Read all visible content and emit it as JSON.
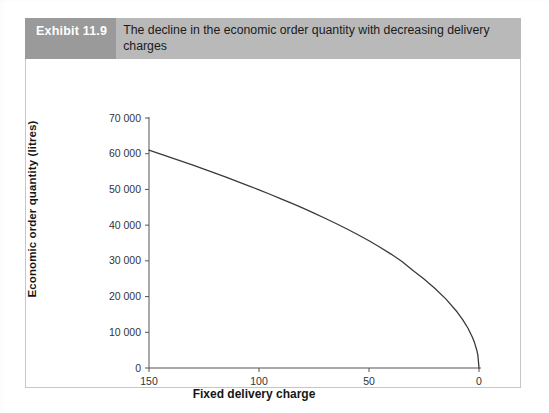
{
  "exhibit": {
    "badge": "Exhibit 11.9",
    "title": "The decline in the economic order quantity with decreasing delivery charges"
  },
  "chart_data": {
    "type": "line",
    "title": "The decline in the economic order quantity with decreasing delivery charges",
    "xlabel": "Fixed delivery charge",
    "ylabel": "Economic order quantity (litres)",
    "xlim": [
      150,
      0
    ],
    "ylim": [
      0,
      70000
    ],
    "x_reversed": true,
    "grid": false,
    "legend": null,
    "xticks": [
      150,
      100,
      50,
      0
    ],
    "xticklabels": [
      "150",
      "100",
      "50",
      "0"
    ],
    "yticks": [
      0,
      10000,
      20000,
      30000,
      40000,
      50000,
      60000,
      70000
    ],
    "yticklabels": [
      "0",
      "10 000",
      "20 000",
      "30 000",
      "40 000",
      "50 000",
      "60 000",
      "70 000"
    ],
    "series": [
      {
        "name": "Economic order quantity",
        "color": "#3a3a3a",
        "x": [
          150,
          145,
          140,
          135,
          130,
          125,
          120,
          115,
          110,
          105,
          100,
          95,
          90,
          85,
          80,
          75,
          70,
          65,
          60,
          55,
          50,
          45,
          40,
          35,
          30,
          25,
          20,
          15,
          10,
          7.5,
          5,
          3,
          2,
          1,
          0.5,
          0
        ],
        "y": [
          61000,
          59970,
          58925,
          57863,
          56784,
          55687,
          54571,
          53434,
          52275,
          51092,
          49884,
          48647,
          47380,
          46079,
          44742,
          43363,
          41938,
          40461,
          38923,
          37315,
          35623,
          33825,
          31897,
          29840,
          27268,
          24894,
          22270,
          19287,
          15748,
          13638,
          11136,
          8626,
          7043,
          4980,
          3521,
          0
        ]
      }
    ]
  }
}
